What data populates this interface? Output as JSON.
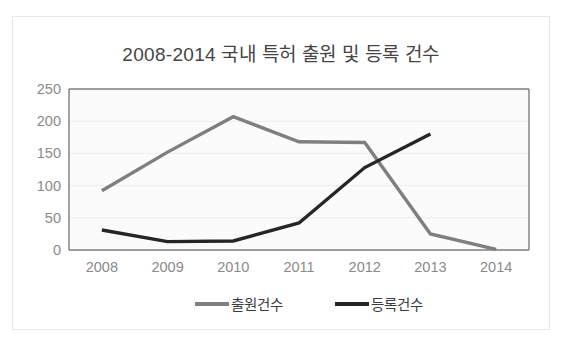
{
  "chart_data": {
    "type": "line",
    "title": "2008-2014 국내 특허 출원 및 등록 건수",
    "xlabel": "",
    "ylabel": "",
    "categories": [
      "2008",
      "2009",
      "2010",
      "2011",
      "2012",
      "2013",
      "2014"
    ],
    "ylim": [
      0,
      250
    ],
    "yticks": [
      0,
      50,
      100,
      150,
      200,
      250
    ],
    "ytick_labels": [
      "0",
      "50",
      "100",
      "150",
      "200",
      "250"
    ],
    "grid": true,
    "grid_axis": "y",
    "legend_position": "bottom",
    "series": [
      {
        "name": "출원건수",
        "color": "#7f7f7f",
        "values": [
          92,
          152,
          207,
          168,
          167,
          25,
          1
        ]
      },
      {
        "name": "등록건수",
        "color": "#262626",
        "values": [
          31,
          13,
          14,
          42,
          128,
          180,
          null
        ]
      }
    ]
  },
  "colors": {
    "series_gray": "#7f7f7f",
    "series_black": "#262626",
    "axis": "#7d7d7d",
    "grid": "#eceded",
    "tick_text": "#8a8a8a",
    "title_text": "#454545",
    "frame_border": "#e9e9e9",
    "plot_bg": "#fbfbfb",
    "page_bg": "#ffffff"
  }
}
